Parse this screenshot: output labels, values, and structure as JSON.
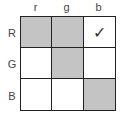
{
  "columns": [
    "r",
    "g",
    "b"
  ],
  "rows": [
    "R",
    "G",
    "B"
  ],
  "cells": [
    [
      {
        "shaded": true,
        "mark": ""
      },
      {
        "shaded": true,
        "mark": ""
      },
      {
        "shaded": false,
        "mark": "✓"
      }
    ],
    [
      {
        "shaded": false,
        "mark": ""
      },
      {
        "shaded": true,
        "mark": ""
      },
      {
        "shaded": false,
        "mark": ""
      }
    ],
    [
      {
        "shaded": false,
        "mark": ""
      },
      {
        "shaded": false,
        "mark": ""
      },
      {
        "shaded": true,
        "mark": ""
      }
    ]
  ],
  "colors": {
    "shaded": "#c4c4c4",
    "border": "#222222",
    "background": "#ffffff"
  }
}
